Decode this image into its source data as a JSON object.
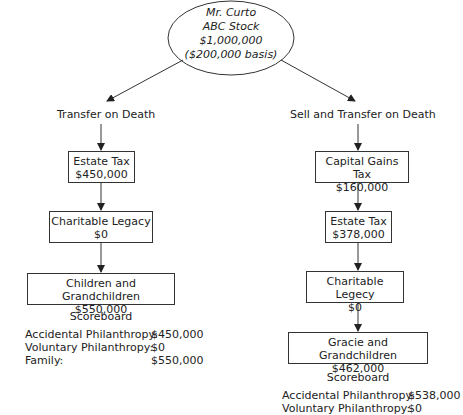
{
  "root": {
    "line1": "Mr. Curto",
    "line2": "ABC Stock",
    "line3": "$1,000,000",
    "line4": "($200,000 basis)"
  },
  "left": {
    "branch_label": "Transfer on Death",
    "steps": [
      {
        "title": "Estate Tax",
        "amount": "$450,000"
      },
      {
        "title": "Charitable Legacy",
        "amount": "$0"
      },
      {
        "title": "Children and Grandchildren",
        "amount": "$550,000"
      }
    ],
    "scoreboard": {
      "title": "Scoreboard",
      "rows": [
        {
          "label": "Accidental Philanthropy:",
          "value": "$450,000"
        },
        {
          "label": "Voluntary Philanthropy:",
          "value": "$0"
        },
        {
          "label": "Family:",
          "value": "$550,000"
        }
      ]
    }
  },
  "right": {
    "branch_label": "Sell and Transfer on Death",
    "steps": [
      {
        "title": "Capital Gains Tax",
        "amount": "$160,000"
      },
      {
        "title": "Estate Tax",
        "amount": "$378,000"
      },
      {
        "title": "Charitable Legecy",
        "amount": "$0"
      },
      {
        "title": "Gracie and Grandchildren",
        "amount": "$462,000"
      }
    ],
    "scoreboard": {
      "title": "Scoreboard",
      "rows": [
        {
          "label": "Accidental Philanthropy:",
          "value": "$538,000"
        },
        {
          "label": "Voluntary Philanthropy:",
          "value": "$0"
        }
      ]
    }
  }
}
